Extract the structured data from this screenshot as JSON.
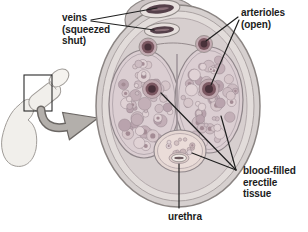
{
  "labels": {
    "veins": "veins\n(squeezed\nshut)",
    "arterioles": "arterioles\n(open)",
    "erectile_tissue": "blood-filled\nerectile tissue",
    "urethra": "urethra"
  },
  "palette": {
    "background": "#ffffff",
    "leader_line": "#1f1f1f",
    "text": "#1c1c1c",
    "skin_outer": "#d6d0cf",
    "skin_ring2": "#e2dcda",
    "skin_ring3": "#d7cfcf",
    "mound": "#cdc5c5",
    "tissue_base": "#dbced2",
    "bubble_tones": [
      "#cdbcc2",
      "#c3afb7",
      "#d6c6ca",
      "#b9a3ad",
      "#e0d2d5",
      "#a48c95"
    ],
    "bubble_stroke": "#97868e",
    "vessel_core": "#49313a",
    "vessel_mid": "#7c5862",
    "vessel_ring": "#c2aab1",
    "vein_dark": "#55404a",
    "vein_slit": "#8a6f78",
    "spongiosum": "#e5d7d3",
    "spongiosum_bubble_a": "#d3c1c1",
    "spongiosum_bubble_b": "#c9b5b7",
    "inset_fill": "#f1efeb",
    "inset_stroke": "#a09c98",
    "arrow_fill": "#b3afab",
    "arrow_outline": "#6b6764"
  }
}
